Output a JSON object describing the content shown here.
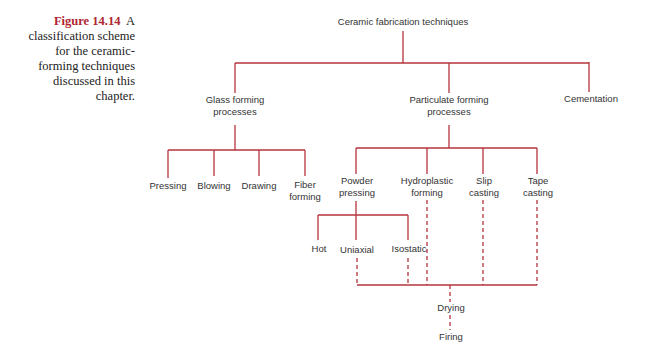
{
  "caption": {
    "figure_label": "Figure 14.14",
    "text": "A classification scheme for the ceramic-forming techniques discussed in this chapter."
  },
  "diagram": {
    "line_color": "#b5343c",
    "root": "Ceramic fabrication techniques",
    "level1": {
      "glass": [
        "Glass forming",
        "processes"
      ],
      "particulate": [
        "Particulate forming",
        "processes"
      ],
      "cementation": "Cementation"
    },
    "glass_children": {
      "pressing": "Pressing",
      "blowing": "Blowing",
      "drawing": "Drawing",
      "fiber": [
        "Fiber",
        "forming"
      ]
    },
    "particulate_children": {
      "powder": [
        "Powder",
        "pressing"
      ],
      "hydroplastic": [
        "Hydroplastic",
        "forming"
      ],
      "slip": [
        "Slip",
        "casting"
      ],
      "tape": [
        "Tape",
        "casting"
      ]
    },
    "powder_children": {
      "hot": "Hot",
      "uniaxial": "Uniaxial",
      "isostatic": "Isostatic"
    },
    "post_steps": {
      "drying": "Drying",
      "firing": "Firing"
    }
  }
}
